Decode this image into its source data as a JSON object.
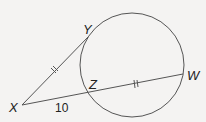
{
  "figure": {
    "type": "geometry-tangent-secant",
    "circle": {
      "cx": 132,
      "cy": 65,
      "r": 52
    },
    "points": {
      "X": {
        "label": "X",
        "x": 22,
        "y": 105
      },
      "Y": {
        "label": "Y",
        "x": 88,
        "y": 37
      },
      "Z": {
        "label": "Z",
        "x": 88,
        "y": 94
      },
      "W": {
        "label": "W",
        "x": 183,
        "y": 74
      }
    },
    "segments": [
      {
        "name": "XY",
        "role": "tangent",
        "marks": "double-tick"
      },
      {
        "name": "XW",
        "role": "secant"
      },
      {
        "name": "ZW",
        "role": "chord",
        "marks": "double-tick"
      }
    ],
    "measures": {
      "XZ": "10"
    },
    "colors": {
      "stroke": "#555555",
      "text": "#222222",
      "background": "#f4f3f2"
    }
  }
}
